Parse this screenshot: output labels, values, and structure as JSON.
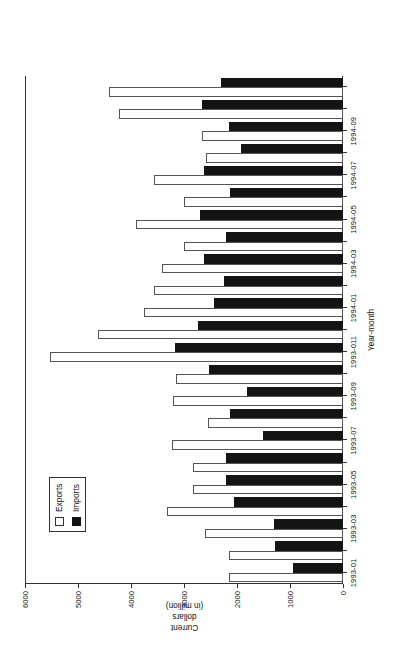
{
  "chart_data": {
    "type": "bar",
    "title": "",
    "subtitle": "",
    "orientation": "rotated-90-ccw",
    "xlabel": "Year-month",
    "ylabel": "Current dollars (in million)",
    "ylabel_lines": [
      "Current",
      "dollars",
      "(in million)"
    ],
    "ylim": [
      0,
      6000
    ],
    "ytick_values": [
      0,
      1000,
      2000,
      3000,
      4000,
      5000,
      6000
    ],
    "ytick_labels": [
      "0",
      "1000",
      "2000",
      "3000",
      "4000",
      "5000",
      "6000"
    ],
    "grid": false,
    "legend_position": "left-inside",
    "legend": [
      "Exports",
      "Imports"
    ],
    "categories": [
      "1993-01",
      "1993-02",
      "1993-03",
      "1993-04",
      "1993-05",
      "1993-06",
      "1993-07",
      "1993-08",
      "1993-09",
      "1993-10",
      "1993-011",
      "1993-12",
      "1994-01",
      "1994-02",
      "1994-03",
      "1994-04",
      "1994-05",
      "1994-06",
      "1994-07",
      "1994-08",
      "1994-09",
      "1994-10",
      "1994-11"
    ],
    "xtick_labels_shown": [
      "1993-01",
      "1993-03",
      "1993-05",
      "1993-07",
      "1993-09",
      "1993-011",
      "1994-01",
      "1994-03",
      "1994-05",
      "1994-07",
      "1994-09"
    ],
    "series": [
      {
        "name": "Exports",
        "color": "#ffffff",
        "values": [
          2150,
          2150,
          2600,
          3320,
          2830,
          2830,
          3220,
          2540,
          3210,
          3160,
          5530,
          4620,
          3760,
          3570,
          3420,
          3000,
          3910,
          3000,
          3560,
          2580,
          2670,
          4230,
          4415
        ]
      },
      {
        "name": "Imports",
        "color": "#141414",
        "values": [
          940,
          1280,
          1300,
          2060,
          2200,
          2200,
          1510,
          2140,
          1810,
          2520,
          3170,
          2740,
          2430,
          2250,
          2620,
          2210,
          2700,
          2130,
          2620,
          1930,
          2150,
          2660,
          2300
        ]
      }
    ]
  },
  "legend": {
    "exports_label": "Exports",
    "imports_label": "Imports"
  },
  "axes": {
    "x_title": "Year-month",
    "y_title_line1": "Current",
    "y_title_line2": "dollars",
    "y_title_line3": "(in million)"
  }
}
